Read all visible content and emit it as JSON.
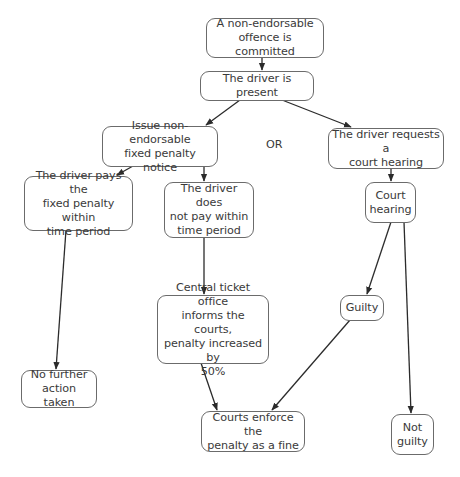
{
  "diagram": {
    "nodes": {
      "offence": {
        "label": "A non-endorsable\noffence is committed"
      },
      "present": {
        "label": "The driver is present"
      },
      "issue_notice": {
        "label": "Issue non-endorsable\nfixed penalty notice"
      },
      "request_hearing": {
        "label": "The driver requests a\ncourt hearing"
      },
      "pays": {
        "label": "The driver pays the\nfixed penalty within\ntime period"
      },
      "not_pay": {
        "label": "The driver does\nnot pay within\ntime period"
      },
      "court_hearing": {
        "label": "Court\nhearing"
      },
      "central_office": {
        "label": "Central ticket office\ninforms the courts,\npenalty increased by\n50%"
      },
      "guilty": {
        "label": "Guilty"
      },
      "no_further": {
        "label": "No further\naction taken"
      },
      "courts_enforce": {
        "label": "Courts enforce the\npenalty as a fine"
      },
      "not_guilty": {
        "label": "Not\nguilty"
      }
    },
    "or_label": "OR",
    "edges": [
      {
        "from": "offence",
        "to": "present"
      },
      {
        "from": "present",
        "to": "issue_notice"
      },
      {
        "from": "present",
        "to": "request_hearing"
      },
      {
        "from": "issue_notice",
        "to": "pays"
      },
      {
        "from": "issue_notice",
        "to": "not_pay"
      },
      {
        "from": "request_hearing",
        "to": "court_hearing"
      },
      {
        "from": "court_hearing",
        "to": "guilty"
      },
      {
        "from": "court_hearing",
        "to": "not_guilty"
      },
      {
        "from": "pays",
        "to": "no_further"
      },
      {
        "from": "not_pay",
        "to": "central_office"
      },
      {
        "from": "central_office",
        "to": "courts_enforce"
      },
      {
        "from": "guilty",
        "to": "courts_enforce"
      }
    ],
    "colors": {
      "border": "#6b6b6b",
      "text": "#3a3a3a",
      "edge": "#2b2b2b",
      "background": "#ffffff"
    }
  }
}
